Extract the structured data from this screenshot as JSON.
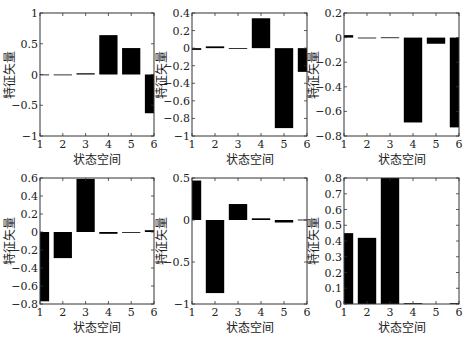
{
  "figure": {
    "rows": 2,
    "cols": 3
  },
  "chart_data": [
    {
      "type": "bar",
      "panel": "row1-col1",
      "title": "",
      "xlabel": "状态空间",
      "ylabel": "特征矢量",
      "categories": [
        1,
        2,
        3,
        4,
        5,
        6
      ],
      "values": [
        -0.01,
        -0.01,
        0.02,
        0.64,
        0.43,
        -0.63
      ],
      "xlim": [
        1,
        6
      ],
      "ylim": [
        -1,
        1
      ],
      "yticks": [
        -1,
        -0.5,
        0,
        0.5,
        1
      ],
      "ytick_labels": [
        "−1",
        "−0.5",
        "0",
        "0.5",
        "1"
      ],
      "xticks": [
        1,
        2,
        3,
        4,
        5,
        6
      ],
      "grid": false,
      "legend": null,
      "bar_color": "#000000"
    },
    {
      "type": "bar",
      "panel": "row1-col2",
      "title": "",
      "xlabel": "状态空间",
      "ylabel": "特征矢量",
      "categories": [
        1,
        2,
        3,
        4,
        5,
        6
      ],
      "values": [
        -0.02,
        0.02,
        0.0,
        0.34,
        -0.91,
        -0.27
      ],
      "xlim": [
        1,
        6
      ],
      "ylim": [
        -1,
        0.4
      ],
      "yticks": [
        -1,
        -0.8,
        -0.6,
        -0.4,
        -0.2,
        0,
        0.2,
        0.4
      ],
      "ytick_labels": [
        "−1",
        "−0.8",
        "−0.6",
        "−0.4",
        "−0.2",
        "0",
        "0.2",
        "0.4"
      ],
      "xticks": [
        1,
        2,
        3,
        4,
        5,
        6
      ],
      "grid": false,
      "legend": null,
      "bar_color": "#000000"
    },
    {
      "type": "bar",
      "panel": "row1-col3",
      "title": "",
      "xlabel": "状态空间",
      "ylabel": "特征矢量",
      "categories": [
        1,
        2,
        3,
        4,
        5,
        6
      ],
      "values": [
        0.02,
        -0.005,
        0.002,
        -0.69,
        -0.05,
        -0.73
      ],
      "xlim": [
        1,
        6
      ],
      "ylim": [
        -0.8,
        0.2
      ],
      "yticks": [
        -0.8,
        -0.6,
        -0.4,
        -0.2,
        0,
        0.2
      ],
      "ytick_labels": [
        "−0.8",
        "−0.6",
        "−0.4",
        "−0.2",
        "0",
        "0.2"
      ],
      "xticks": [
        1,
        2,
        3,
        4,
        5,
        6
      ],
      "grid": false,
      "legend": null,
      "bar_color": "#000000"
    },
    {
      "type": "bar",
      "panel": "row2-col1",
      "title": "",
      "xlabel": "状态空间",
      "ylabel": "特征矢量",
      "categories": [
        1,
        2,
        3,
        4,
        5,
        6
      ],
      "values": [
        -0.77,
        -0.29,
        0.59,
        -0.02,
        0.0,
        0.02
      ],
      "xlim": [
        1,
        6
      ],
      "ylim": [
        -0.8,
        0.6
      ],
      "yticks": [
        -0.8,
        -0.6,
        -0.4,
        -0.2,
        0,
        0.2,
        0.4,
        0.6
      ],
      "ytick_labels": [
        "−0.8",
        "−0.6",
        "−0.4",
        "−0.2",
        "0",
        "0.2",
        "0.4",
        "0.6"
      ],
      "xticks": [
        1,
        2,
        3,
        4,
        5,
        6
      ],
      "grid": false,
      "legend": null,
      "bar_color": "#000000"
    },
    {
      "type": "bar",
      "panel": "row2-col2",
      "title": "",
      "xlabel": "状态空间",
      "ylabel": "特征矢量",
      "categories": [
        1,
        2,
        3,
        4,
        5,
        6
      ],
      "values": [
        0.47,
        -0.87,
        0.19,
        0.02,
        -0.03,
        0.005
      ],
      "xlim": [
        1,
        6
      ],
      "ylim": [
        -1,
        0.5
      ],
      "yticks": [
        -1,
        -0.5,
        0,
        0.5
      ],
      "ytick_labels": [
        "−1",
        "−0.5",
        "0",
        "0.5"
      ],
      "xticks": [
        1,
        2,
        3,
        4,
        5,
        6
      ],
      "grid": false,
      "legend": null,
      "bar_color": "#000000"
    },
    {
      "type": "bar",
      "panel": "row2-col3",
      "title": "",
      "xlabel": "状态空间",
      "ylabel": "特征矢量",
      "categories": [
        1,
        2,
        3,
        4,
        5,
        6
      ],
      "values": [
        0.45,
        0.42,
        0.8,
        0.005,
        0.0,
        0.005
      ],
      "xlim": [
        1,
        6
      ],
      "ylim": [
        0,
        0.8
      ],
      "yticks": [
        0,
        0.1,
        0.2,
        0.3,
        0.4,
        0.5,
        0.6,
        0.7,
        0.8
      ],
      "ytick_labels": [
        "0",
        "0.1",
        "0.2",
        "0.3",
        "0.4",
        "0.5",
        "0.6",
        "0.7",
        "0.8"
      ],
      "xticks": [
        1,
        2,
        3,
        4,
        5,
        6
      ],
      "grid": false,
      "legend": null,
      "bar_color": "#000000"
    }
  ]
}
